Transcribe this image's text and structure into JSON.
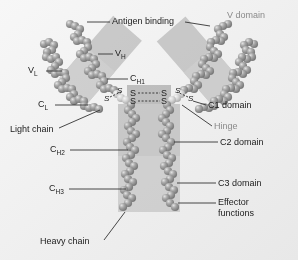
{
  "figure": {
    "background_color": "#efefef",
    "bead_color": "#8c8c8c",
    "bead_highlight": "#d8d8d8",
    "shade_box_color": "#b9b9b9",
    "label_color": "#1c1c1c",
    "gray_label_color": "#8a8a8a"
  },
  "labels": {
    "antigen_binding": "Antigen binding",
    "v_domain": "V domain",
    "v_h": "V",
    "v_h_sub": "H",
    "v_l": "V",
    "v_l_sub": "L",
    "c_h1": "C",
    "c_h1_sub": "H1",
    "c_l": "C",
    "c_l_sub": "L",
    "c1_domain": "C1 domain",
    "hinge": "Hinge",
    "light_chain": "Light chain",
    "c_h2": "C",
    "c_h2_sub": "H2",
    "c2_domain": "C2 domain",
    "c_h3": "C",
    "c_h3_sub": "H3",
    "c3_domain": "C3 domain",
    "effector_functions_line1": "Effector",
    "effector_functions_line2": "functions",
    "heavy_chain": "Heavy chain",
    "disulfide_s": "S"
  },
  "disulfide_bonds": {
    "inter_heavy_count": 2,
    "light_heavy_count": 2,
    "symbol": "S",
    "bond_style": "dashed"
  },
  "domains": [
    {
      "name": "V domain",
      "region": "upper arms",
      "shaded": true
    },
    {
      "name": "C1 domain",
      "region": "lower arms",
      "shaded": true
    },
    {
      "name": "C2 domain",
      "region": "upper stem",
      "shaded": true
    },
    {
      "name": "C3 domain",
      "region": "lower stem",
      "shaded": true
    }
  ],
  "chains": [
    {
      "name": "Light chain",
      "domains": [
        "VL",
        "CL"
      ]
    },
    {
      "name": "Heavy chain",
      "domains": [
        "VH",
        "CH1",
        "CH2",
        "CH3"
      ]
    }
  ]
}
